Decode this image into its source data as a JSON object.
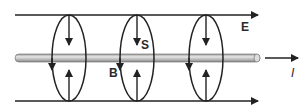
{
  "diagram": {
    "labels": {
      "E": "E",
      "S": "S",
      "B": "B",
      "I": "I"
    },
    "colors": {
      "line": "#222222",
      "rod": "#b8b8b8",
      "rod_edge": "#555555"
    }
  }
}
